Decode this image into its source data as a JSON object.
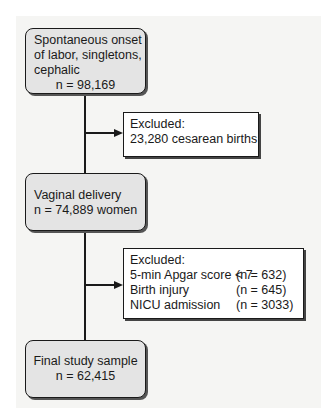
{
  "flowchart": {
    "nodes": [
      {
        "id": "start",
        "lines": [
          "Spontaneous onset",
          "of labor, singletons,",
          "cephalic"
        ],
        "count": "n = 98,169"
      },
      {
        "id": "vaginal",
        "lines": [
          "Vaginal delivery"
        ],
        "count": "n = 74,889 women"
      },
      {
        "id": "final",
        "lines": [
          "Final study sample"
        ],
        "count": "n = 62,415"
      }
    ],
    "exclusions": [
      {
        "title": "Excluded:",
        "items": [
          {
            "label": "23,280 cesarean births",
            "count": ""
          }
        ]
      },
      {
        "title": "Excluded:",
        "items": [
          {
            "label": "5-min Apgar score < 7",
            "count": "(n = 632)"
          },
          {
            "label": "Birth injury",
            "count": "(n = 645)"
          },
          {
            "label": "NICU admission",
            "count": "(n = 3033)"
          }
        ]
      }
    ],
    "colors": {
      "node_fill": "#e4e4e4",
      "exclusion_fill": "#ffffff",
      "line": "#1a1a1a",
      "background": "#f5f5f3"
    }
  }
}
